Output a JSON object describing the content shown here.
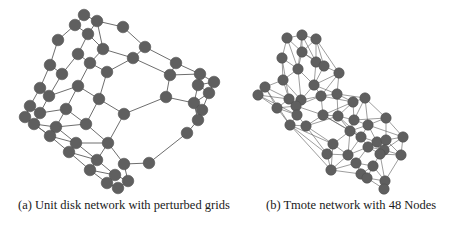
{
  "figure": {
    "subfigures": [
      {
        "id": "a",
        "caption": "(a) Unit disk network with perturbed grids",
        "node_color": "#5f5f5f",
        "edge_color": "#6e6e6e",
        "nodes": [
          [
            84,
            15
          ],
          [
            97,
            21
          ],
          [
            75,
            25
          ],
          [
            123,
            27
          ],
          [
            88,
            34
          ],
          [
            58,
            40
          ],
          [
            145,
            47
          ],
          [
            103,
            49
          ],
          [
            78,
            54
          ],
          [
            133,
            58
          ],
          [
            50,
            65
          ],
          [
            90,
            63
          ],
          [
            176,
            63
          ],
          [
            62,
            74
          ],
          [
            107,
            72
          ],
          [
            170,
            75
          ],
          [
            200,
            74
          ],
          [
            214,
            82
          ],
          [
            78,
            86
          ],
          [
            198,
            85
          ],
          [
            40,
            88
          ],
          [
            49,
            96
          ],
          [
            99,
            99
          ],
          [
            209,
            93
          ],
          [
            166,
            97
          ],
          [
            194,
            103
          ],
          [
            30,
            106
          ],
          [
            40,
            113
          ],
          [
            66,
            109
          ],
          [
            202,
            110
          ],
          [
            124,
            114
          ],
          [
            25,
            117
          ],
          [
            34,
            124
          ],
          [
            198,
            120
          ],
          [
            56,
            127
          ],
          [
            86,
            124
          ],
          [
            50,
            136
          ],
          [
            76,
            143
          ],
          [
            108,
            143
          ],
          [
            187,
            133
          ],
          [
            69,
            152
          ],
          [
            97,
            160
          ],
          [
            149,
            163
          ],
          [
            124,
            164
          ],
          [
            90,
            170
          ],
          [
            115,
            175
          ],
          [
            128,
            181
          ],
          [
            107,
            183
          ],
          [
            118,
            188
          ]
        ],
        "edges": [
          [
            0,
            1
          ],
          [
            0,
            2
          ],
          [
            1,
            3
          ],
          [
            2,
            4
          ],
          [
            1,
            4
          ],
          [
            2,
            5
          ],
          [
            3,
            6
          ],
          [
            4,
            7
          ],
          [
            1,
            7
          ],
          [
            4,
            8
          ],
          [
            5,
            10
          ],
          [
            6,
            9
          ],
          [
            6,
            12
          ],
          [
            7,
            9
          ],
          [
            8,
            11
          ],
          [
            8,
            13
          ],
          [
            7,
            11
          ],
          [
            9,
            14
          ],
          [
            9,
            15
          ],
          [
            11,
            14
          ],
          [
            10,
            13
          ],
          [
            12,
            15
          ],
          [
            12,
            16
          ],
          [
            15,
            16
          ],
          [
            16,
            17
          ],
          [
            16,
            19
          ],
          [
            17,
            19
          ],
          [
            15,
            24
          ],
          [
            19,
            23
          ],
          [
            17,
            23
          ],
          [
            19,
            25
          ],
          [
            23,
            25
          ],
          [
            24,
            25
          ],
          [
            24,
            30
          ],
          [
            25,
            29
          ],
          [
            23,
            29
          ],
          [
            29,
            33
          ],
          [
            25,
            33
          ],
          [
            10,
            20
          ],
          [
            13,
            21
          ],
          [
            11,
            18
          ],
          [
            14,
            22
          ],
          [
            18,
            21
          ],
          [
            18,
            22
          ],
          [
            20,
            21
          ],
          [
            20,
            26
          ],
          [
            21,
            27
          ],
          [
            18,
            28
          ],
          [
            22,
            30
          ],
          [
            26,
            27
          ],
          [
            26,
            31
          ],
          [
            27,
            28
          ],
          [
            27,
            32
          ],
          [
            28,
            35
          ],
          [
            22,
            35
          ],
          [
            31,
            32
          ],
          [
            32,
            34
          ],
          [
            28,
            34
          ],
          [
            35,
            34
          ],
          [
            35,
            38
          ],
          [
            30,
            38
          ],
          [
            31,
            36
          ],
          [
            32,
            36
          ],
          [
            34,
            37
          ],
          [
            36,
            37
          ],
          [
            37,
            38
          ],
          [
            36,
            40
          ],
          [
            37,
            41
          ],
          [
            38,
            41
          ],
          [
            40,
            41
          ],
          [
            40,
            44
          ],
          [
            41,
            44
          ],
          [
            38,
            43
          ],
          [
            43,
            42
          ],
          [
            42,
            39
          ],
          [
            39,
            33
          ],
          [
            41,
            45
          ],
          [
            44,
            47
          ],
          [
            45,
            47
          ],
          [
            45,
            46
          ],
          [
            46,
            43
          ],
          [
            47,
            48
          ],
          [
            46,
            48
          ],
          [
            44,
            45
          ]
        ]
      },
      {
        "id": "b",
        "caption": "(b) Tmote network with 48 Nodes",
        "node_color": "#5f5f5f",
        "edge_color": "#5a5a5a",
        "nodes": [
          [
            287,
            38
          ],
          [
            302,
            35
          ],
          [
            316,
            39
          ],
          [
            282,
            58
          ],
          [
            302,
            52
          ],
          [
            316,
            62
          ],
          [
            324,
            66
          ],
          [
            298,
            69
          ],
          [
            339,
            73
          ],
          [
            283,
            80
          ],
          [
            314,
            85
          ],
          [
            265,
            87
          ],
          [
            258,
            95
          ],
          [
            289,
            99
          ],
          [
            301,
            100
          ],
          [
            321,
            96
          ],
          [
            337,
            94
          ],
          [
            277,
            108
          ],
          [
            296,
            106
          ],
          [
            353,
            102
          ],
          [
            365,
            98
          ],
          [
            297,
            115
          ],
          [
            323,
            115
          ],
          [
            338,
            116
          ],
          [
            354,
            120
          ],
          [
            290,
            125
          ],
          [
            306,
            126
          ],
          [
            386,
            118
          ],
          [
            350,
            131
          ],
          [
            368,
            125
          ],
          [
            361,
            137
          ],
          [
            403,
            137
          ],
          [
            333,
            144
          ],
          [
            377,
            142
          ],
          [
            386,
            140
          ],
          [
            348,
            155
          ],
          [
            368,
            147
          ],
          [
            327,
            154
          ],
          [
            331,
            170
          ],
          [
            356,
            163
          ],
          [
            384,
            150
          ],
          [
            361,
            174
          ],
          [
            380,
            154
          ],
          [
            401,
            155
          ],
          [
            367,
            178
          ],
          [
            373,
            166
          ],
          [
            385,
            181
          ],
          [
            384,
            189
          ]
        ],
        "edges": [
          [
            0,
            1
          ],
          [
            1,
            2
          ],
          [
            0,
            3
          ],
          [
            0,
            4
          ],
          [
            1,
            4
          ],
          [
            2,
            4
          ],
          [
            2,
            5
          ],
          [
            1,
            5
          ],
          [
            4,
            5
          ],
          [
            5,
            6
          ],
          [
            4,
            7
          ],
          [
            3,
            7
          ],
          [
            2,
            6
          ],
          [
            6,
            8
          ],
          [
            4,
            6
          ],
          [
            3,
            9
          ],
          [
            7,
            9
          ],
          [
            5,
            10
          ],
          [
            7,
            10
          ],
          [
            6,
            10
          ],
          [
            8,
            10
          ],
          [
            9,
            11
          ],
          [
            11,
            12
          ],
          [
            9,
            13
          ],
          [
            11,
            13
          ],
          [
            7,
            14
          ],
          [
            9,
            14
          ],
          [
            10,
            14
          ],
          [
            10,
            15
          ],
          [
            8,
            15
          ],
          [
            15,
            16
          ],
          [
            8,
            16
          ],
          [
            12,
            17
          ],
          [
            11,
            17
          ],
          [
            13,
            17
          ],
          [
            13,
            18
          ],
          [
            14,
            18
          ],
          [
            17,
            18
          ],
          [
            15,
            18
          ],
          [
            16,
            19
          ],
          [
            15,
            19
          ],
          [
            19,
            20
          ],
          [
            16,
            20
          ],
          [
            17,
            21
          ],
          [
            18,
            21
          ],
          [
            14,
            21
          ],
          [
            13,
            21
          ],
          [
            18,
            22
          ],
          [
            15,
            22
          ],
          [
            16,
            23
          ],
          [
            19,
            23
          ],
          [
            22,
            23
          ],
          [
            19,
            24
          ],
          [
            20,
            24
          ],
          [
            23,
            24
          ],
          [
            17,
            25
          ],
          [
            21,
            25
          ],
          [
            21,
            26
          ],
          [
            22,
            26
          ],
          [
            25,
            26
          ],
          [
            26,
            23
          ],
          [
            24,
            27
          ],
          [
            20,
            27
          ],
          [
            24,
            28
          ],
          [
            23,
            28
          ],
          [
            22,
            28
          ],
          [
            27,
            29
          ],
          [
            24,
            29
          ],
          [
            28,
            29
          ],
          [
            28,
            30
          ],
          [
            29,
            30
          ],
          [
            27,
            31
          ],
          [
            29,
            31
          ],
          [
            26,
            32
          ],
          [
            28,
            32
          ],
          [
            25,
            32
          ],
          [
            30,
            33
          ],
          [
            29,
            33
          ],
          [
            31,
            34
          ],
          [
            33,
            34
          ],
          [
            27,
            34
          ],
          [
            30,
            35
          ],
          [
            32,
            35
          ],
          [
            28,
            35
          ],
          [
            30,
            36
          ],
          [
            33,
            36
          ],
          [
            35,
            36
          ],
          [
            25,
            37
          ],
          [
            32,
            37
          ],
          [
            26,
            37
          ],
          [
            37,
            38
          ],
          [
            35,
            38
          ],
          [
            32,
            38
          ],
          [
            35,
            39
          ],
          [
            36,
            39
          ],
          [
            38,
            39
          ],
          [
            34,
            40
          ],
          [
            33,
            40
          ],
          [
            36,
            40
          ],
          [
            39,
            41
          ],
          [
            38,
            41
          ],
          [
            40,
            42
          ],
          [
            36,
            42
          ],
          [
            34,
            43
          ],
          [
            31,
            43
          ],
          [
            40,
            43
          ],
          [
            42,
            43
          ],
          [
            41,
            44
          ],
          [
            39,
            44
          ],
          [
            42,
            45
          ],
          [
            39,
            45
          ],
          [
            44,
            45
          ],
          [
            45,
            46
          ],
          [
            42,
            46
          ],
          [
            44,
            46
          ],
          [
            46,
            47
          ],
          [
            44,
            47
          ],
          [
            43,
            46
          ],
          [
            12,
            21
          ],
          [
            11,
            25
          ],
          [
            3,
            13
          ],
          [
            1,
            7
          ],
          [
            0,
            7
          ],
          [
            2,
            8
          ],
          [
            14,
            15
          ],
          [
            10,
            16
          ],
          [
            19,
            22
          ],
          [
            20,
            29
          ],
          [
            22,
            30
          ],
          [
            23,
            30
          ],
          [
            37,
            35
          ],
          [
            31,
            40
          ],
          [
            33,
            42
          ],
          [
            41,
            45
          ],
          [
            25,
            38
          ],
          [
            12,
            13
          ]
        ]
      }
    ]
  }
}
